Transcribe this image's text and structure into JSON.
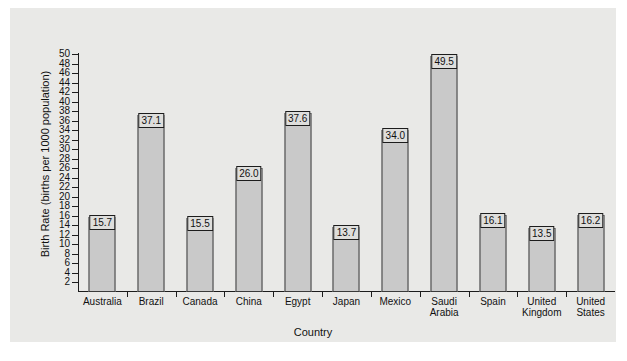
{
  "chart_data": {
    "type": "bar",
    "title": "",
    "xlabel": "Country",
    "ylabel": "Birth Rate (births per 1000 population)",
    "categories": [
      "Australia",
      "Brazil",
      "Canada",
      "China",
      "Egypt",
      "Japan",
      "Mexico",
      "Saudi Arabia",
      "Spain",
      "United Kingdom",
      "United States"
    ],
    "category_lines": [
      [
        "Australia"
      ],
      [
        "Brazil"
      ],
      [
        "Canada"
      ],
      [
        "China"
      ],
      [
        "Egypt"
      ],
      [
        "Japan"
      ],
      [
        "Mexico"
      ],
      [
        "Saudi",
        "Arabia"
      ],
      [
        "Spain"
      ],
      [
        "United",
        "Kingdom"
      ],
      [
        "United",
        "States"
      ]
    ],
    "values": [
      15.7,
      37.1,
      15.5,
      26.0,
      37.6,
      13.7,
      34.0,
      49.5,
      16.1,
      13.5,
      16.2
    ],
    "value_labels": [
      "15.7",
      "37.1",
      "15.5",
      "26.0",
      "37.6",
      "13.7",
      "34.0",
      "49.5",
      "16.1",
      "13.5",
      "16.2"
    ],
    "ylim": [
      0,
      51
    ],
    "yticks": [
      2,
      4,
      6,
      8,
      10,
      12,
      14,
      16,
      18,
      20,
      22,
      24,
      26,
      28,
      30,
      32,
      34,
      36,
      38,
      40,
      42,
      44,
      46,
      48,
      50
    ],
    "ytick_labels": [
      "2",
      "4",
      "6",
      "8",
      "10",
      "12",
      "14",
      "16",
      "18",
      "20",
      "22",
      "24",
      "26",
      "28",
      "30",
      "32",
      "34",
      "36",
      "38",
      "40",
      "42",
      "44",
      "46",
      "48",
      "50"
    ],
    "grid": false,
    "legend": null,
    "colors": {
      "bar_fill": "#c9c9c9",
      "bar_edge": "#3a3a3a",
      "panel_background": "#e9e9e7",
      "figure_background": "#ffffff",
      "axis": "#1c1c1c",
      "label_box_fill": "#dededc",
      "text": "#111111"
    }
  }
}
